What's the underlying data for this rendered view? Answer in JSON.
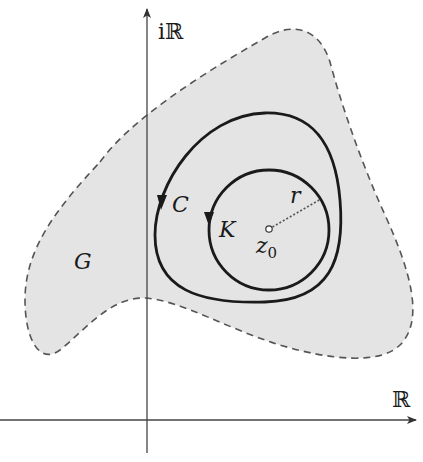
{
  "figure": {
    "axes": {
      "real_label": "ℝ",
      "imag_label": "iℝ"
    },
    "region": {
      "label": "G",
      "fill": "#e4e4e4",
      "boundary_style": "dashed"
    },
    "curves": [
      {
        "label": "C",
        "kind": "closed contour",
        "orientation": "counterclockwise"
      },
      {
        "label": "K",
        "kind": "circle",
        "orientation": "counterclockwise"
      }
    ],
    "center": {
      "label": "z",
      "subscript": "0"
    },
    "radius": {
      "label": "r"
    },
    "colors": {
      "stroke": "#1a1a1a",
      "axis": "#444444",
      "region_fill": "#e4e4e4",
      "region_border": "#555555"
    }
  }
}
